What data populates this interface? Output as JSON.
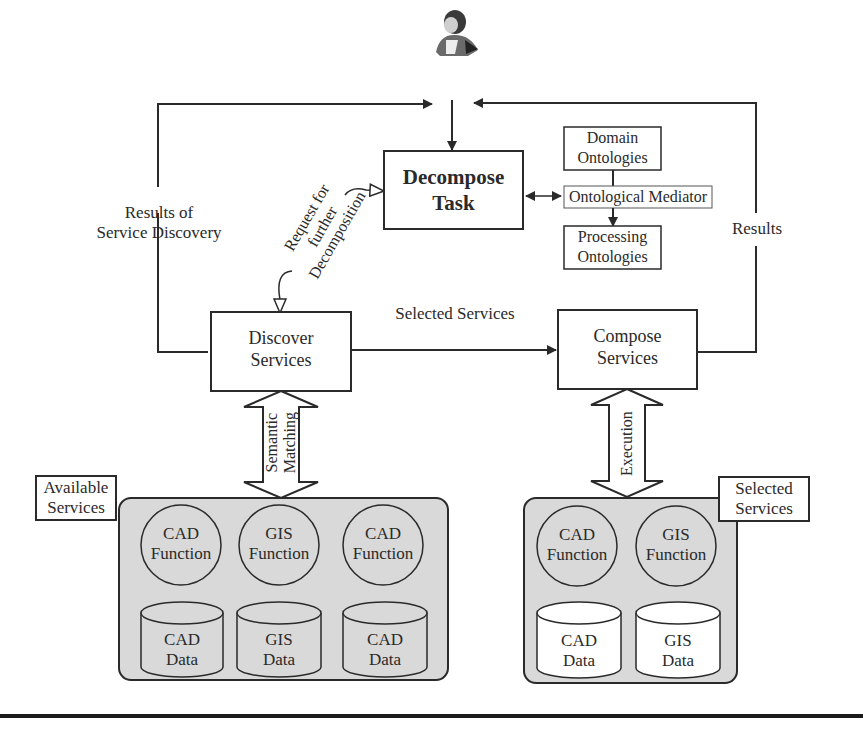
{
  "diagram": {
    "user": {
      "icon": "user-person-icon"
    },
    "decompose_task": {
      "line1": "Decompose",
      "line2": "Task"
    },
    "ontologies": {
      "domain": {
        "line1": "Domain",
        "line2": "Ontologies"
      },
      "mediator": "Ontological Mediator",
      "processing": {
        "line1": "Processing",
        "line2": "Ontologies"
      }
    },
    "discover_services": {
      "line1": "Discover",
      "line2": "Services"
    },
    "compose_services": {
      "line1": "Compose",
      "line2": "Services"
    },
    "edges": {
      "results_of_discovery": {
        "line1": "Results of",
        "line2": "Service Discovery"
      },
      "request_decomposition": {
        "line1": "Request for",
        "line2": "further",
        "line3": "Decomposition"
      },
      "selected_services": "Selected Services",
      "results": "Results",
      "semantic_matching": {
        "line1": "Semantic",
        "line2": "Matching"
      },
      "execution": "Execution"
    },
    "available_services": {
      "title": {
        "line1": "Available",
        "line2": "Services"
      },
      "functions": [
        {
          "line1": "CAD",
          "line2": "Function"
        },
        {
          "line1": "GIS",
          "line2": "Function"
        },
        {
          "line1": "CAD",
          "line2": "Function"
        }
      ],
      "data": [
        {
          "line1": "CAD",
          "line2": "Data"
        },
        {
          "line1": "GIS",
          "line2": "Data"
        },
        {
          "line1": "CAD",
          "line2": "Data"
        }
      ]
    },
    "selected_services_group": {
      "title": {
        "line1": "Selected",
        "line2": "Services"
      },
      "functions": [
        {
          "line1": "CAD",
          "line2": "Function"
        },
        {
          "line1": "GIS",
          "line2": "Function"
        }
      ],
      "data": [
        {
          "line1": "CAD",
          "line2": "Data"
        },
        {
          "line1": "GIS",
          "line2": "Data"
        }
      ]
    },
    "colors": {
      "line": "#2a2a2a",
      "group_fill": "#d9d9d9",
      "box_fill": "#ffffff"
    }
  }
}
